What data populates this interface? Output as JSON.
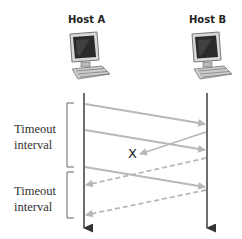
{
  "hosts": {
    "a": {
      "label": "Host A"
    },
    "b": {
      "label": "Host B"
    }
  },
  "timeouts": [
    {
      "line1": "Timeout",
      "line2": "interval"
    },
    {
      "line1": "Timeout",
      "line2": "interval"
    }
  ],
  "lost_marker": "X",
  "colors": {
    "timeline": "#4a4a4a",
    "packet": "#b8b8b8",
    "bracket": "#555555",
    "text": "#333333"
  },
  "messages": [
    {
      "type": "data",
      "from": "A",
      "to": "B",
      "style": "solid"
    },
    {
      "type": "data",
      "from": "A",
      "to": "B",
      "style": "solid"
    },
    {
      "type": "ack",
      "from": "B",
      "to": "A",
      "style": "solid",
      "lost": true
    },
    {
      "type": "ack",
      "from": "B",
      "to": "A",
      "style": "dashed"
    },
    {
      "type": "data",
      "from": "A",
      "to": "B",
      "style": "solid"
    },
    {
      "type": "ack",
      "from": "B",
      "to": "A",
      "style": "dashed"
    }
  ]
}
